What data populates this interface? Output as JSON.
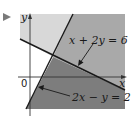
{
  "marker": {
    "icon": "play-triangle-icon",
    "color": "#7a7a7a"
  },
  "axes": {
    "x_label": "x",
    "y_label": "y",
    "origin_label": "0"
  },
  "lines": [
    {
      "id": "line1",
      "equation": "x + 2y = 6"
    },
    {
      "id": "line2",
      "equation": "2x − y = 2"
    }
  ],
  "regions": {
    "upper_left_color": "#d8d8d8",
    "upper_right_color": "#a9a9a9",
    "lower_right_color": "#7d7d7d",
    "lower_left_color": "#ffffff"
  },
  "colors": {
    "line": "#1a1a1a",
    "axis": "#333333"
  }
}
